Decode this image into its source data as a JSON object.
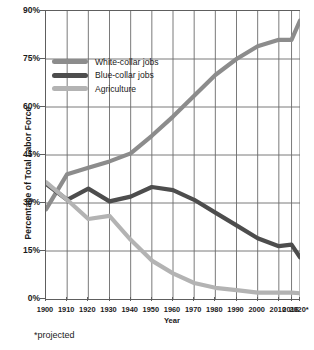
{
  "chart_data": {
    "type": "line",
    "title": "",
    "xlabel": "Year",
    "ylabel": "Percentage of Total Labor Force",
    "footnote": "*projected",
    "grid": true,
    "legend_position": "top-left",
    "xlim": [
      1900,
      2020
    ],
    "ylim": [
      0,
      90
    ],
    "yticks": [
      "0%",
      "15%",
      "30%",
      "45%",
      "60%",
      "75%",
      "90%"
    ],
    "ytick_values": [
      0,
      15,
      30,
      45,
      60,
      75,
      90
    ],
    "categories": [
      "1900",
      "1910",
      "1920",
      "1930",
      "1940",
      "1950",
      "1960",
      "1970",
      "1980",
      "1990",
      "2000",
      "2010",
      "2016",
      "2020*"
    ],
    "x": [
      1900,
      1910,
      1920,
      1930,
      1940,
      1950,
      1960,
      1970,
      1980,
      1990,
      2000,
      2010,
      2016,
      2020
    ],
    "series": [
      {
        "name": "White-collar jobs",
        "color": "#8c8c8c",
        "values": [
          28,
          39,
          41,
          43,
          45.5,
          51,
          57,
          63.5,
          70,
          75,
          79,
          81,
          81,
          87
        ]
      },
      {
        "name": "Blue-collar jobs",
        "color": "#4d4d4d",
        "values": [
          36,
          31,
          34.5,
          30.5,
          32,
          35,
          34,
          31,
          27,
          23,
          19,
          16.5,
          17,
          13
        ]
      },
      {
        "name": "Agriculture",
        "color": "#b3b3b3",
        "values": [
          36.5,
          31,
          25,
          26,
          18.5,
          12,
          8,
          5,
          3.5,
          2.8,
          2,
          2,
          2,
          1.8
        ]
      }
    ]
  },
  "legend": {
    "items": [
      {
        "label": "White-collar jobs",
        "color": "#8c8c8c"
      },
      {
        "label": "Blue-collar jobs",
        "color": "#4d4d4d"
      },
      {
        "label": "Agriculture",
        "color": "#b3b3b3"
      }
    ]
  },
  "axes": {
    "y_title": "Percentage of Total Labor Force",
    "x_title": "Year"
  },
  "footnote": "*projected",
  "colors": {
    "axis": "#5e5e5e",
    "grid": "#6b6b6b",
    "text": "#1a1a1a",
    "background": "#ffffff"
  }
}
